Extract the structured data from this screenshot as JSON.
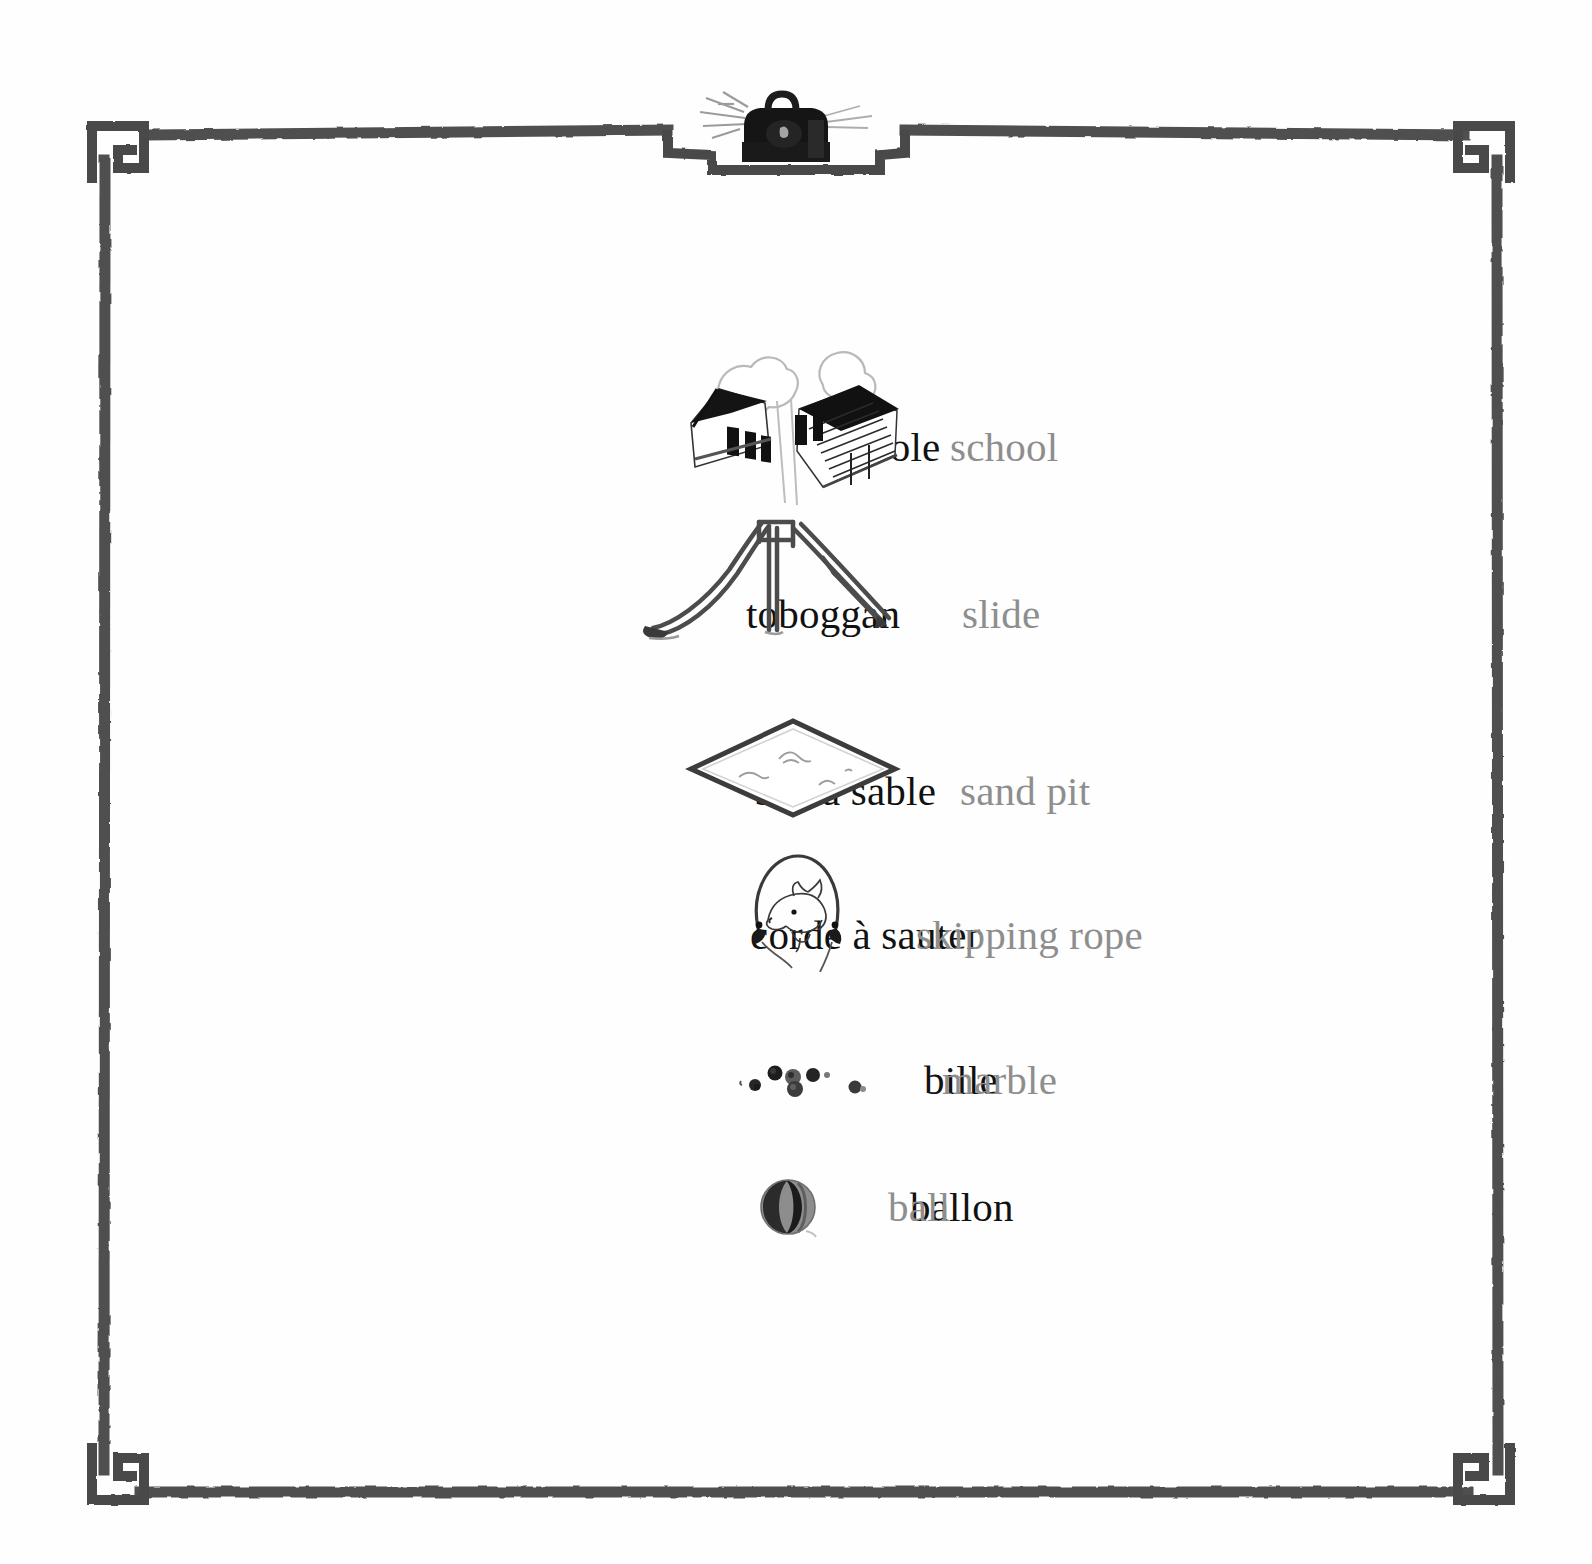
{
  "page": {
    "background_color": "#fefefe",
    "frame_color": "#4a4a4a",
    "french_text_color": "#111111",
    "english_text_color": "#8e8e8e"
  },
  "ornament": {
    "top_center_icon": "school-satchel-icon",
    "corner_icon": "greek-key-spiral-corner"
  },
  "entries": [
    {
      "french": "école",
      "english": "school",
      "illustration": "school-building-icon",
      "fr_x": 620,
      "en_x": 950,
      "y": 447,
      "img_x": 788,
      "img_y": 422
    },
    {
      "french": "toboggan",
      "english": "slide",
      "illustration": "playground-slide-icon",
      "fr_x": 585,
      "en_x": 962,
      "y": 614,
      "img_x": 772,
      "img_y": 575
    },
    {
      "french": "bac à sable",
      "english": "sand pit",
      "illustration": "sand-pit-icon",
      "fr_x": 602,
      "en_x": 960,
      "y": 791,
      "img_x": 793,
      "img_y": 768
    },
    {
      "french": "corde à sauter",
      "english": "skipping rope",
      "illustration": "skipping-rope-icon",
      "fr_x": 674,
      "en_x": 916,
      "y": 935,
      "img_x": 797,
      "img_y": 907
    },
    {
      "french": "bille",
      "english": "marble",
      "illustration": "marbles-icon",
      "fr_x": 672,
      "en_x": 942,
      "y": 1080,
      "img_x": 810,
      "img_y": 1075
    },
    {
      "french": "ballon",
      "english": "ball",
      "illustration": "ball-icon",
      "fr_x": 692,
      "en_x": 888,
      "y": 1207,
      "img_x": 789,
      "img_y": 1207
    }
  ]
}
